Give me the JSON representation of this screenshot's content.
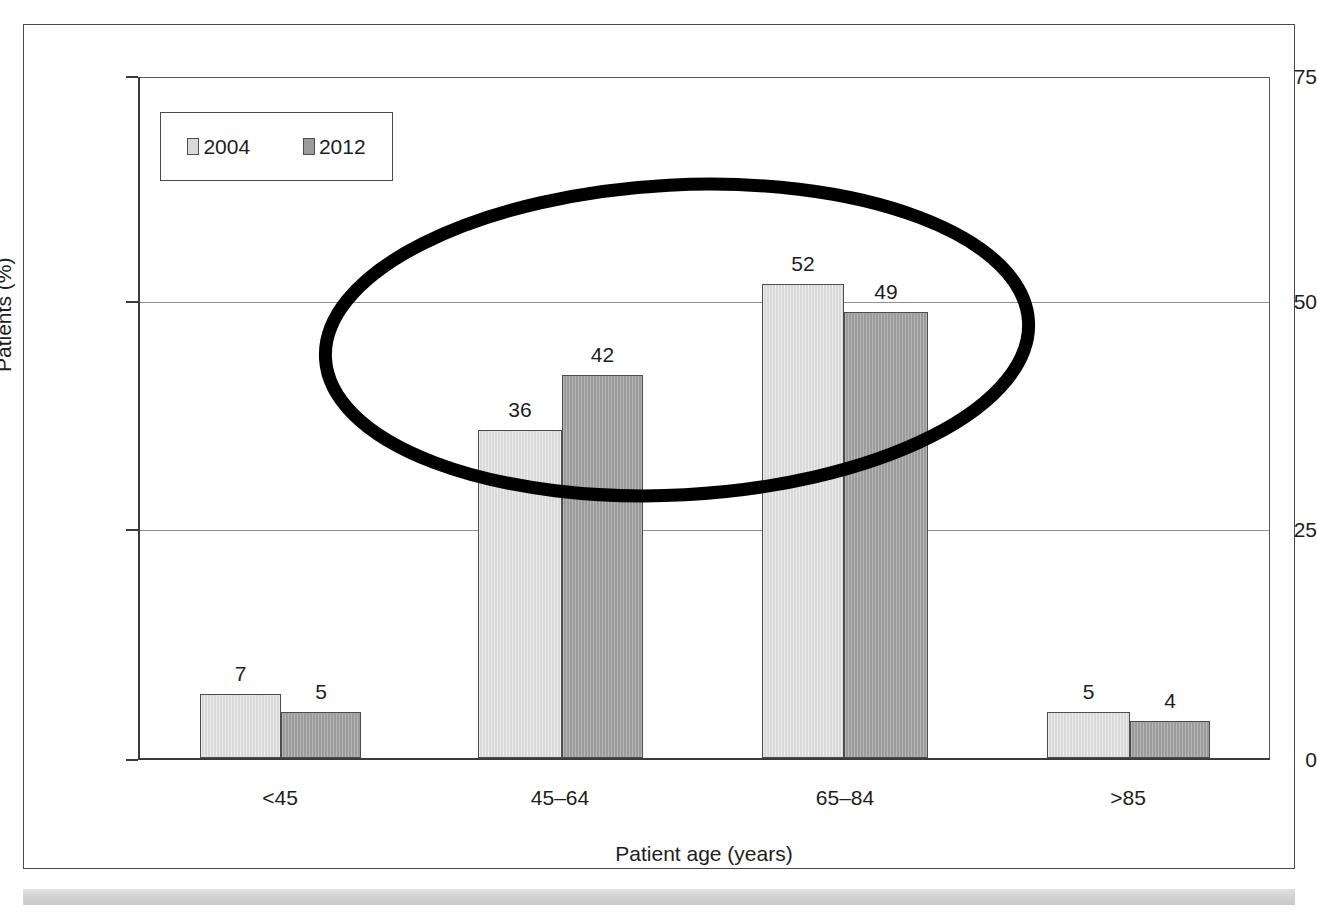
{
  "figure": {
    "frame_border_color": "#4a4a4a",
    "background_color": "#ffffff",
    "bottom_band_color": "#d2d2d2"
  },
  "legend": {
    "position": "inside-top-left",
    "entries": [
      {
        "label": "2004",
        "swatch_name": "legend-swatch-2004",
        "color": "#d9d9d9"
      },
      {
        "label": "2012",
        "swatch_name": "legend-swatch-2012",
        "color": "#9b9b9b"
      }
    ]
  },
  "axes": {
    "y_title": "Patients (%)",
    "x_title": "Patient age (years)",
    "y_ticks": [
      "0",
      "25",
      "50",
      "75"
    ],
    "x_ticks": [
      "<45",
      "45–64",
      "65–84",
      ">85"
    ]
  },
  "annotation": {
    "type": "ellipse",
    "name": "highlight-ellipse",
    "color": "#000000",
    "stroke_width": 13,
    "center_x": 677,
    "center_y": 340,
    "radius_x": 352,
    "radius_y": 155,
    "rotation_deg": -3
  },
  "bar_labels": {
    "g1s1": "7",
    "g1s2": "5",
    "g2s1": "36",
    "g2s2": "42",
    "g3s1": "52",
    "g3s2": "49",
    "g4s1": "5",
    "g4s2": "4"
  },
  "chart_data": {
    "type": "bar",
    "title": "",
    "subtitle": "",
    "xlabel": "Patient age (years)",
    "ylabel": "Patients (%)",
    "categories": [
      "<45",
      "45–64",
      "65–84",
      ">85"
    ],
    "series": [
      {
        "name": "2004",
        "color": "#d9d9d9",
        "values": [
          7,
          36,
          52,
          5
        ]
      },
      {
        "name": "2012",
        "color": "#9b9b9b",
        "values": [
          5,
          42,
          49,
          4
        ]
      }
    ],
    "ylim": [
      0,
      75
    ],
    "yticks": [
      0,
      25,
      50,
      75
    ],
    "grid": true,
    "grid_axis": "y",
    "legend_position": "upper left",
    "data_labels": true,
    "annotations": [
      {
        "kind": "ellipse",
        "description": "hand-drawn black ellipse highlighting the 45–64 and 65–84 age groups",
        "covers_categories": [
          "45–64",
          "65–84"
        ]
      }
    ]
  }
}
